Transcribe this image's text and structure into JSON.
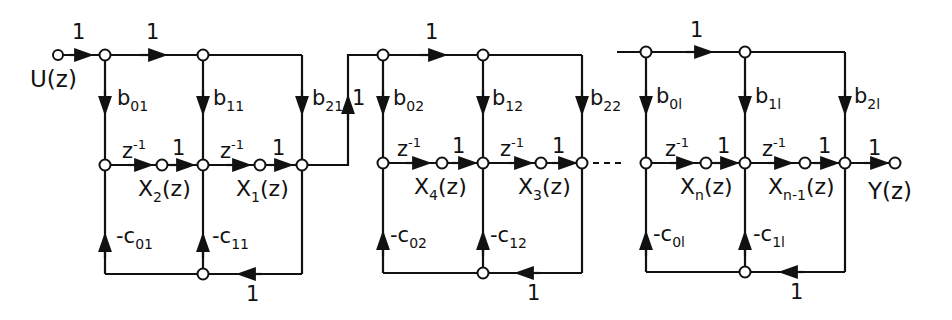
{
  "diagram": {
    "type": "signal-flow-graph",
    "input_label": "U(z)",
    "output_label": "Y(z)",
    "colors": {
      "ink": "#111111",
      "background": "#ffffff"
    },
    "input_gain": "1",
    "output_gain": "1",
    "sections": [
      {
        "top_gain": "1",
        "b": [
          {
            "b": "b",
            "s": "01"
          },
          {
            "b": "b",
            "s": "11"
          },
          {
            "b": "b",
            "s": "21"
          }
        ],
        "c": [
          {
            "b": "-c",
            "s": "01"
          },
          {
            "b": "-c",
            "s": "11"
          }
        ],
        "delays": [
          {
            "z": "z",
            "e": "-1",
            "g": "1"
          },
          {
            "z": "z",
            "e": "-1",
            "g": "1"
          }
        ],
        "states": [
          {
            "x": "X",
            "s": "2",
            "t": "(z)"
          },
          {
            "x": "X",
            "s": "1",
            "t": "(z)"
          }
        ],
        "feedback_gain": "1"
      },
      {
        "connector_gain": "1",
        "top_gain": "1",
        "b": [
          {
            "b": "b",
            "s": "02"
          },
          {
            "b": "b",
            "s": "12"
          },
          {
            "b": "b",
            "s": "22"
          }
        ],
        "c": [
          {
            "b": "-c",
            "s": "02"
          },
          {
            "b": "-c",
            "s": "12"
          }
        ],
        "delays": [
          {
            "z": "z",
            "e": "-1",
            "g": "1"
          },
          {
            "z": "z",
            "e": "-1",
            "g": "1"
          }
        ],
        "states": [
          {
            "x": "X",
            "s": "4",
            "t": "(z)"
          },
          {
            "x": "X",
            "s": "3",
            "t": "(z)"
          }
        ],
        "feedback_gain": "1"
      },
      {
        "top_gain": "1",
        "b": [
          {
            "b": "b",
            "s": "0l"
          },
          {
            "b": "b",
            "s": "1l"
          },
          {
            "b": "b",
            "s": "2l"
          }
        ],
        "c": [
          {
            "b": "-c",
            "s": "0l"
          },
          {
            "b": "-c",
            "s": "1l"
          }
        ],
        "delays": [
          {
            "z": "z",
            "e": "-1",
            "g": "1"
          },
          {
            "z": "z",
            "e": "-1",
            "g": "1"
          }
        ],
        "states": [
          {
            "x": "X",
            "s": "n",
            "t": "(z)"
          },
          {
            "x": "X",
            "s": "n-1",
            "t": "(z)"
          }
        ],
        "feedback_gain": "1"
      }
    ]
  }
}
